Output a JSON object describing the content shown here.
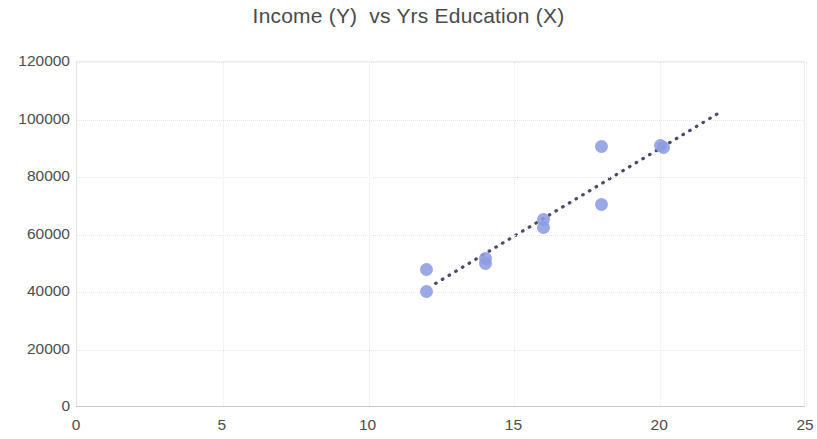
{
  "chart_data": {
    "type": "scatter",
    "title": "Income (Y)  vs Yrs Education (X)",
    "xlabel": "",
    "ylabel": "",
    "xlim": [
      0,
      25
    ],
    "ylim": [
      0,
      120000
    ],
    "x_ticks": [
      "0",
      "5",
      "10",
      "15",
      "20",
      "25"
    ],
    "x_tick_values": [
      0,
      5,
      10,
      15,
      20,
      25
    ],
    "y_ticks": [
      "0",
      "20000",
      "40000",
      "60000",
      "80000",
      "100000",
      "120000"
    ],
    "y_tick_values": [
      0,
      20000,
      40000,
      60000,
      80000,
      100000,
      120000
    ],
    "grid": true,
    "legend": null,
    "marker_color": "#8d9ce2",
    "trendline_color": "#4a4a6a",
    "points": [
      {
        "x": 12,
        "y": 48000
      },
      {
        "x": 12,
        "y": 40300
      },
      {
        "x": 14,
        "y": 51500
      },
      {
        "x": 14,
        "y": 50000
      },
      {
        "x": 16,
        "y": 65200
      },
      {
        "x": 16,
        "y": 62500
      },
      {
        "x": 18,
        "y": 90500
      },
      {
        "x": 18,
        "y": 70500
      },
      {
        "x": 20,
        "y": 90800
      },
      {
        "x": 20.1,
        "y": 90300
      }
    ],
    "trendline": {
      "type": "linear",
      "style": "dotted",
      "x_start": 12.3,
      "y_start": 43000,
      "x_end": 22.05,
      "y_end": 102500
    }
  }
}
